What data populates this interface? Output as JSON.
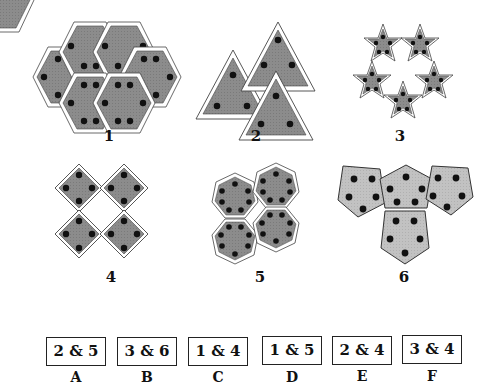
{
  "figures": [
    {
      "number": "1",
      "shape": "hexagon",
      "count": 6,
      "dots_per_shape": 6
    },
    {
      "number": "2",
      "shape": "triangle",
      "count": 3,
      "dots_per_shape": 3
    },
    {
      "number": "3",
      "shape": "star",
      "count": 6,
      "dots_per_shape": 5
    },
    {
      "number": "4",
      "shape": "diamond",
      "count": 4,
      "dots_per_shape": 4
    },
    {
      "number": "5",
      "shape": "heptagon",
      "count": 4,
      "dots_per_shape": 7
    },
    {
      "number": "6",
      "shape": "pentagon",
      "count": 4,
      "dots_per_shape": 5
    }
  ],
  "options": [
    {
      "letter": "A",
      "value": "2 & 5"
    },
    {
      "letter": "B",
      "value": "3 & 6"
    },
    {
      "letter": "C",
      "value": "1 & 4"
    },
    {
      "letter": "D",
      "value": "1 & 5"
    },
    {
      "letter": "E",
      "value": "2 & 4"
    },
    {
      "letter": "F",
      "value": "3 & 4"
    }
  ],
  "colors": {
    "fill": "#8a8a8a",
    "fill_light": "#bdbdbd",
    "dot": "#111111",
    "outline": "#333333"
  }
}
